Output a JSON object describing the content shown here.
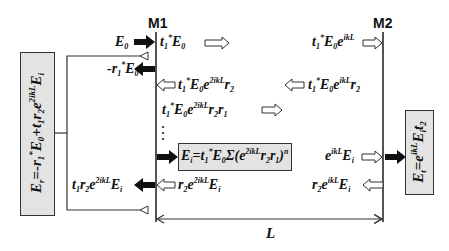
{
  "diagram": {
    "type": "Fabry-Perot cavity field propagation",
    "mirrors": [
      {
        "id": "M1",
        "label": "M1"
      },
      {
        "id": "M2",
        "label": "M2"
      }
    ],
    "cavity_length_label": "L",
    "colors": {
      "line": "#555555",
      "box_fill": "#e3e3e3",
      "box_border": "#333333",
      "solid_arrow": "#111111"
    },
    "equations": {
      "incident": "E0",
      "transmitted_M1": "t1* E0 ⇒",
      "reflected_M1": "-r1* E0",
      "arrive_M2": "t1* E0 e^ikL ⇒",
      "reflect_M2": "⇐ t1* E0 e^ikL r2",
      "return_M1": "⇐ t1* E0 e^2ikL r2",
      "second_pass": "t1* E0 e^2ikL r2 r1 ⇒",
      "intracavity_sum": "Ei = t1* E0 Σ(e^2ikL r2 r1)^n",
      "intracavity_at_M2": "e^ikL Ei ⇒",
      "reflect_Ei_M2": "r2 e^ikL Ei ⇐",
      "return_Ei_M1": "⇐ r2 e^2ikL Ei",
      "leak_M1": "t1 r2 e^2ikL Ei",
      "total_reflected": "Er = -r1* E0 + t1 r2 e^2ikL Ei",
      "total_transmitted": "Et = e^ikL Ei t2"
    }
  }
}
